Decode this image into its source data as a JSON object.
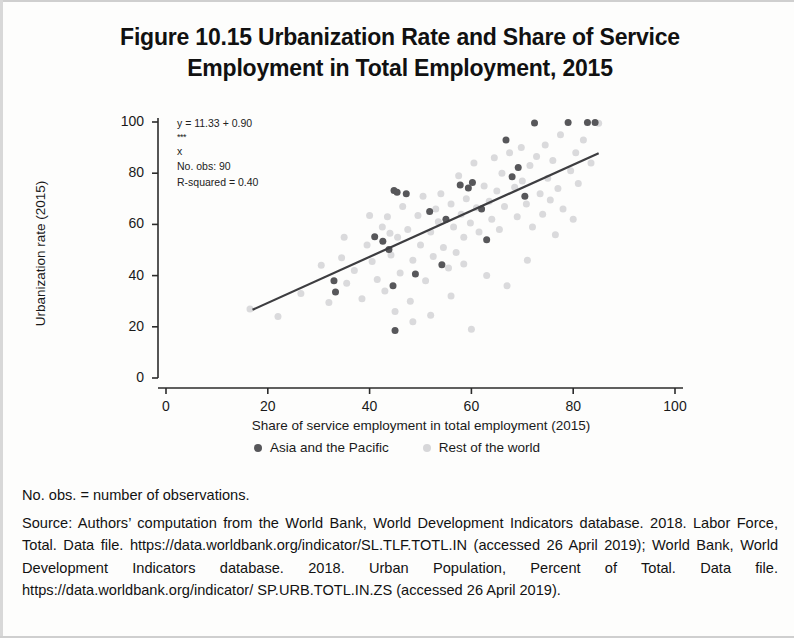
{
  "figure": {
    "title_line1": "Figure 10.15  Urbanization Rate and Share of Service",
    "title_line2": "Employment in Total Employment, 2015"
  },
  "annotation": {
    "equation_prefix": "y = 11.33 + 0.90",
    "equation_stars": "***",
    "equation_suffix": "x",
    "observations": "No. obs: 90",
    "r_squared": "R-squared = 0.40"
  },
  "legend": {
    "items": [
      {
        "label": "Asia and the Pacific",
        "color": "#57575a"
      },
      {
        "label": "Rest of the world",
        "color": "#d7d7d9"
      }
    ]
  },
  "notes": {
    "abbreviation": "No. obs. = number of observations.",
    "source": "Source: Authors’ computation from the World Bank, World Development Indicators database. 2018. Labor Force, Total. Data file. https://data.worldbank.org/indicator/SL.TLF.TOTL.IN (accessed 26 April 2019); World Bank, World Development Indicators database. 2018. Urban Population, Percent of Total. Data file. https://data.worldbank.org/indicator/ SP.URB.TOTL.IN.ZS (accessed 26 April 2019)."
  },
  "chart_data": {
    "type": "scatter",
    "title": "Figure 10.15  Urbanization Rate and Share of Service Employment in Total Employment, 2015",
    "xlabel": "Share of service employment in total employment (2015)",
    "ylabel": "Urbanization rate (2015)",
    "xlim": [
      0,
      103
    ],
    "ylim": [
      0,
      104
    ],
    "xticks": [
      0,
      20,
      40,
      60,
      80,
      100
    ],
    "yticks": [
      0,
      20,
      40,
      60,
      80,
      100
    ],
    "grid": false,
    "legend_position": "bottom-center",
    "annotations": {
      "equation": "y = 11.33 + 0.90***x",
      "n_obs": 90,
      "r_squared": 0.4
    },
    "trendline": {
      "intercept": 11.33,
      "slope": 0.9,
      "x_start": 17,
      "x_end": 85,
      "color": "#3d3d40",
      "width": 2.2
    },
    "series": [
      {
        "name": "Asia and the Pacific",
        "color": "#57575a",
        "marker_size": 7,
        "points": [
          [
            33.0,
            38.0
          ],
          [
            33.3,
            33.6
          ],
          [
            41.0,
            55.2
          ],
          [
            42.6,
            53.4
          ],
          [
            43.8,
            50.2
          ],
          [
            44.6,
            36.0
          ],
          [
            45.0,
            18.6
          ],
          [
            44.8,
            73.2
          ],
          [
            47.2,
            72.0
          ],
          [
            45.4,
            72.6
          ],
          [
            51.8,
            65.0
          ],
          [
            54.2,
            44.2
          ],
          [
            55.0,
            62.0
          ],
          [
            57.8,
            75.4
          ],
          [
            59.4,
            74.2
          ],
          [
            60.2,
            76.4
          ],
          [
            63.0,
            54.0
          ],
          [
            66.8,
            93.0
          ],
          [
            68.0,
            78.6
          ],
          [
            69.2,
            82.2
          ],
          [
            72.4,
            99.6
          ],
          [
            79.0,
            99.8
          ],
          [
            82.8,
            99.8
          ],
          [
            84.3,
            99.8
          ],
          [
            49.0,
            40.6
          ],
          [
            62.0,
            66.0
          ],
          [
            70.5,
            71.0
          ]
        ]
      },
      {
        "name": "Rest of the world",
        "color": "#dadadc",
        "marker_size": 7,
        "points": [
          [
            16.5,
            27.0
          ],
          [
            22.0,
            24.0
          ],
          [
            26.5,
            33.0
          ],
          [
            30.5,
            44.0
          ],
          [
            32.0,
            29.5
          ],
          [
            34.5,
            47.0
          ],
          [
            35.5,
            37.0
          ],
          [
            37.0,
            42.0
          ],
          [
            38.5,
            31.0
          ],
          [
            39.5,
            52.0
          ],
          [
            40.5,
            45.5
          ],
          [
            41.5,
            38.5
          ],
          [
            42.5,
            59.0
          ],
          [
            43.0,
            34.0
          ],
          [
            43.5,
            63.0
          ],
          [
            44.2,
            48.0
          ],
          [
            45.5,
            55.0
          ],
          [
            46.0,
            41.0
          ],
          [
            46.5,
            67.0
          ],
          [
            47.5,
            58.0
          ],
          [
            48.0,
            30.0
          ],
          [
            48.5,
            46.0
          ],
          [
            49.5,
            63.5
          ],
          [
            50.0,
            52.0
          ],
          [
            50.5,
            71.0
          ],
          [
            51.0,
            38.0
          ],
          [
            52.0,
            57.0
          ],
          [
            52.5,
            47.5
          ],
          [
            53.0,
            66.0
          ],
          [
            53.5,
            61.0
          ],
          [
            54.0,
            72.0
          ],
          [
            54.5,
            51.0
          ],
          [
            55.5,
            43.0
          ],
          [
            56.0,
            68.0
          ],
          [
            56.5,
            59.0
          ],
          [
            57.0,
            49.0
          ],
          [
            57.5,
            79.0
          ],
          [
            58.0,
            64.0
          ],
          [
            58.5,
            55.0
          ],
          [
            59.0,
            70.0
          ],
          [
            59.8,
            60.5
          ],
          [
            60.5,
            84.0
          ],
          [
            61.0,
            66.5
          ],
          [
            61.5,
            57.0
          ],
          [
            62.5,
            75.0
          ],
          [
            63.5,
            69.0
          ],
          [
            64.0,
            62.0
          ],
          [
            64.5,
            86.0
          ],
          [
            65.0,
            73.0
          ],
          [
            65.5,
            58.0
          ],
          [
            66.0,
            80.0
          ],
          [
            66.5,
            67.0
          ],
          [
            67.5,
            88.0
          ],
          [
            68.5,
            74.5
          ],
          [
            69.0,
            63.0
          ],
          [
            69.8,
            90.0
          ],
          [
            70.0,
            77.0
          ],
          [
            70.8,
            68.0
          ],
          [
            71.5,
            83.0
          ],
          [
            72.0,
            59.0
          ],
          [
            72.8,
            86.5
          ],
          [
            73.5,
            72.0
          ],
          [
            74.0,
            64.0
          ],
          [
            74.5,
            91.0
          ],
          [
            75.0,
            78.0
          ],
          [
            75.5,
            69.5
          ],
          [
            76.0,
            85.0
          ],
          [
            77.0,
            74.0
          ],
          [
            77.5,
            95.0
          ],
          [
            78.0,
            66.0
          ],
          [
            79.5,
            81.0
          ],
          [
            80.5,
            88.0
          ],
          [
            81.0,
            76.0
          ],
          [
            82.0,
            93.0
          ],
          [
            83.5,
            84.0
          ],
          [
            85.0,
            99.5
          ],
          [
            45.0,
            26.0
          ],
          [
            48.5,
            22.0
          ],
          [
            56.0,
            32.0
          ],
          [
            60.0,
            19.0
          ],
          [
            63.0,
            40.0
          ],
          [
            67.0,
            36.0
          ],
          [
            52.0,
            24.5
          ],
          [
            58.5,
            44.5
          ],
          [
            44.0,
            56.5
          ],
          [
            40.0,
            63.5
          ],
          [
            35.0,
            55.0
          ],
          [
            71.0,
            46.0
          ],
          [
            76.5,
            56.0
          ],
          [
            80.0,
            62.0
          ]
        ]
      }
    ]
  }
}
